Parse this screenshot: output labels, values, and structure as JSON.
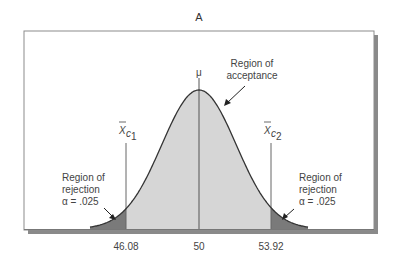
{
  "chart_data": {
    "type": "area",
    "title": "A",
    "subtitle": "",
    "xlabel": "",
    "ylabel": "",
    "distribution": "normal",
    "mean": 50,
    "mean_label": "μ",
    "critical_values": [
      46.08,
      53.92
    ],
    "critical_labels": [
      "X̄c1",
      "X̄c2"
    ],
    "x_ticks": [
      "46.08",
      "50",
      "53.92"
    ],
    "regions": [
      {
        "name": "Region of rejection",
        "side": "left",
        "alpha": ".025",
        "x_range": [
          null,
          46.08
        ],
        "fill": "#7a7a7a"
      },
      {
        "name": "Region of acceptance",
        "side": "center",
        "x_range": [
          46.08,
          53.92
        ],
        "fill": "#d6d6d6"
      },
      {
        "name": "Region of rejection",
        "side": "right",
        "alpha": ".025",
        "x_range": [
          53.92,
          null
        ],
        "fill": "#7a7a7a"
      }
    ],
    "annotations": [
      {
        "text": "Region of acceptance",
        "target": "curve near peak (right shoulder)"
      },
      {
        "text": "Region of rejection α = .025",
        "target": "left tail"
      },
      {
        "text": "Region of rejection α = .025",
        "target": "right tail"
      }
    ],
    "grid": false,
    "legend": "none"
  },
  "labels": {
    "title": "A",
    "mu": "μ",
    "acceptance_line1": "Region of",
    "acceptance_line2": "acceptance",
    "left_rej_line1": "Region of",
    "left_rej_line2": "rejection",
    "left_rej_line3": "α = .025",
    "right_rej_line1": "Region of",
    "right_rej_line2": "rejection",
    "right_rej_line3": "α = .025",
    "xc1_main": "X",
    "xc1_sub": "c",
    "xc1_subsub": "1",
    "xc2_main": "X",
    "xc2_sub": "c",
    "xc2_subsub": "2",
    "tick_left": "46.08",
    "tick_center": "50",
    "tick_right": "53.92"
  },
  "colors": {
    "acceptance_fill": "#d6d6d6",
    "rejection_fill": "#7a7a7a",
    "curve": "#333333",
    "frame_border": "#8c8c8c",
    "frame_shadow": "#8a8a8a"
  }
}
